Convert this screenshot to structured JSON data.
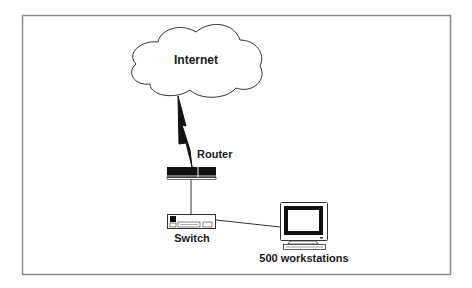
{
  "diagram": {
    "type": "network-topology",
    "colors": {
      "frame": "#8a8a8a",
      "stroke": "#333333",
      "device_fill": "#111111",
      "background": "#ffffff"
    },
    "nodes": {
      "internet": {
        "label": "Internet",
        "icon": "cloud-icon"
      },
      "router": {
        "label": "Router",
        "icon": "router-icon"
      },
      "switch": {
        "label": "Switch",
        "icon": "switch-icon"
      },
      "workstations": {
        "label": "500 workstations",
        "icon": "computer-monitor-icon"
      }
    },
    "links": [
      {
        "from": "internet",
        "to": "router",
        "style": "wan-lightning"
      },
      {
        "from": "router",
        "to": "switch",
        "style": "line"
      },
      {
        "from": "switch",
        "to": "workstations",
        "style": "line"
      }
    ]
  }
}
